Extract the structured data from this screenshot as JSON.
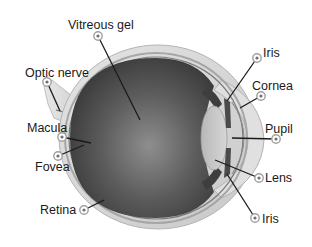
{
  "diagram": {
    "colors": {
      "background": "#ffffff",
      "sclera": "#d8d8d8",
      "sclera_edge": "#b8b8b8",
      "vitreous_dark": "#3c3c3c",
      "vitreous_light": "#8a8a8a",
      "lens": "#c4c4c4",
      "cornea": "#e2e2e2",
      "label_text": "#1a1a1a",
      "marker_ring": "#a0a0a0"
    },
    "labels": [
      {
        "id": "vitreous-gel",
        "text": "Vitreous gel",
        "text_x": 68,
        "text_y": 29,
        "marker_x": 98,
        "marker_y": 36,
        "target_x": 140,
        "target_y": 120,
        "anchor": "start"
      },
      {
        "id": "optic-nerve",
        "text": "Optic nerve",
        "text_x": 25,
        "text_y": 77,
        "marker_x": 47,
        "marker_y": 82,
        "target_x": 60,
        "target_y": 111,
        "anchor": "start"
      },
      {
        "id": "macula",
        "text": "Macula",
        "text_x": 27,
        "text_y": 132,
        "marker_x": 62,
        "marker_y": 137,
        "target_x": 91,
        "target_y": 143,
        "anchor": "start"
      },
      {
        "id": "fovea",
        "text": "Fovea",
        "text_x": 35,
        "text_y": 171,
        "marker_x": 58,
        "marker_y": 156,
        "target_x": 84,
        "target_y": 145,
        "anchor": "start"
      },
      {
        "id": "retina",
        "text": "Retina",
        "text_x": 40,
        "text_y": 214,
        "marker_x": 84,
        "marker_y": 210,
        "target_x": 104,
        "target_y": 200,
        "anchor": "start"
      },
      {
        "id": "iris-top",
        "text": "Iris",
        "text_x": 263,
        "text_y": 57,
        "marker_x": 257,
        "marker_y": 58,
        "target_x": 227,
        "target_y": 101,
        "anchor": "start"
      },
      {
        "id": "cornea",
        "text": "Cornea",
        "text_x": 252,
        "text_y": 90,
        "marker_x": 261,
        "marker_y": 96,
        "target_x": 240,
        "target_y": 108,
        "anchor": "start"
      },
      {
        "id": "pupil",
        "text": "Pupil",
        "text_x": 265,
        "text_y": 133,
        "marker_x": 276,
        "marker_y": 139,
        "target_x": 232,
        "target_y": 138,
        "anchor": "start"
      },
      {
        "id": "lens",
        "text": "Lens",
        "text_x": 265,
        "text_y": 182,
        "marker_x": 259,
        "marker_y": 178,
        "target_x": 215,
        "target_y": 160,
        "anchor": "start"
      },
      {
        "id": "iris-bottom",
        "text": "Iris",
        "text_x": 262,
        "text_y": 223,
        "marker_x": 255,
        "marker_y": 218,
        "target_x": 227,
        "target_y": 174,
        "anchor": "start"
      }
    ]
  }
}
